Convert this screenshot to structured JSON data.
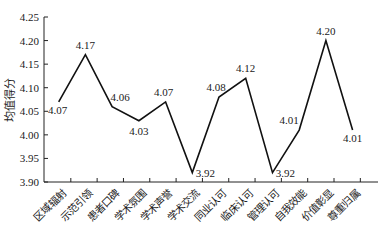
{
  "chart_data": {
    "type": "line",
    "title": "",
    "xlabel": "",
    "ylabel": "均值得分",
    "ylim": [
      3.9,
      4.25
    ],
    "yticks": [
      "3.90",
      "3.95",
      "4.00",
      "4.05",
      "4.10",
      "4.15",
      "4.20",
      "4.25"
    ],
    "grid": false,
    "legend": null,
    "categories": [
      "区域辐射",
      "示范引领",
      "患者口碑",
      "学术氛围",
      "学术声誉",
      "学术交流",
      "同业认可",
      "临床认可",
      "管理认可",
      "自我效能",
      "价值彰显",
      "尊重归属"
    ],
    "values": [
      4.07,
      4.17,
      4.06,
      4.03,
      4.07,
      3.92,
      4.08,
      4.12,
      3.92,
      4.01,
      4.2,
      4.01
    ],
    "data_labels": [
      "4.07",
      "4.17",
      "4.06",
      "4.03",
      "4.07",
      "3.92",
      "4.08",
      "4.12",
      "3.92",
      "4.01",
      "4.20",
      "4.01"
    ]
  }
}
